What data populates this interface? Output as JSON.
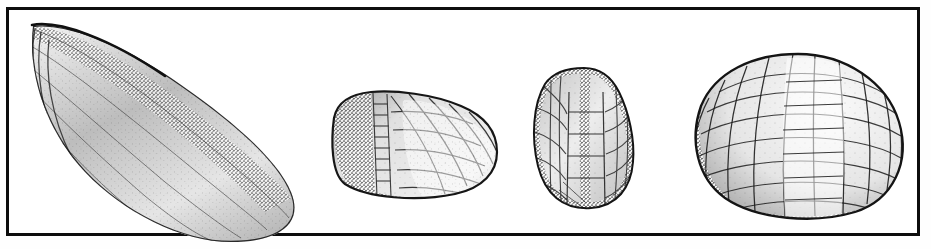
{
  "plate": {
    "kind": "scanned-engraving-plate",
    "background_color": "#ffffff",
    "ink_color": "#111111",
    "border": {
      "present": true,
      "style": "thin-rectangular-rule",
      "color": "#0d0d0d",
      "thickness_px": 3,
      "x": 6,
      "y": 7,
      "width": 914,
      "height": 229
    },
    "technique": "stipple and line engraving, monochrome halftone scan",
    "caption": "",
    "labels": [],
    "figure_count": 4
  },
  "figures": [
    {
      "index": 1,
      "name": "mussel-shell-lateral-view",
      "description": "Elongate teardrop bivalve shell, umbo at upper left, broad rounded posterior at lower right, tilted about 35 degrees; concentric growth lines and heavy stippled shading along the dorsal ridge",
      "bbox": {
        "x": 18,
        "y": 16,
        "width": 270,
        "height": 218
      },
      "shading": "dense stipple along dorsal margin fading to light ventral field",
      "tessellated": false
    },
    {
      "index": 2,
      "name": "barnacle-plated-body-oblique-view",
      "description": "Rounded wedge-shaped plated body seen obliquely; narrow vertical band of small rectangular plates at left, large polygonal plates across the face",
      "bbox": {
        "x": 330,
        "y": 98,
        "width": 170,
        "height": 105
      },
      "shading": "dark stipple at left margin and lower edge",
      "tessellated": true
    },
    {
      "index": 3,
      "name": "barnacle-plated-body-dorsal-view",
      "description": "Bilobed ovate body with a deep median cleft at the top and a central column of rectangular plates flanked by irregular polygons",
      "bbox": {
        "x": 533,
        "y": 74,
        "width": 108,
        "height": 142
      },
      "shading": "stippled outline and median groove, pale plate interiors",
      "tessellated": true
    },
    {
      "index": 4,
      "name": "barnacle-plated-body-lateral-view",
      "description": "Large dome or globe with meridional rows of quadrate plates radiating from the apex, broad and rounded at the base",
      "bbox": {
        "x": 706,
        "y": 60,
        "width": 198,
        "height": 163
      },
      "shading": "heavy stipple on the left flank and base, highlight toward the right",
      "tessellated": true
    }
  ]
}
